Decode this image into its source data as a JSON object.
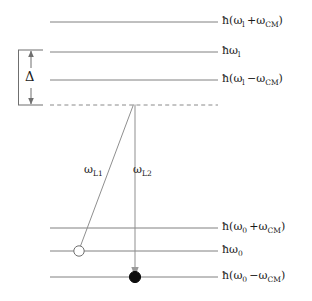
{
  "figure": {
    "type": "energy-level-diagram",
    "title": "",
    "background_color": "#ffffff",
    "line_color": "#808080",
    "text_color": "#1a1a1a",
    "transition_color": "#909090"
  },
  "upper_manifold": {
    "levels": [
      {
        "id": "upper-plus",
        "label": "ħ(ωl+ωCM)",
        "label_html": "ħ(ω<sub>l</sub> +ω<sub>CM</sub>)",
        "style": "solid",
        "y": 22
      },
      {
        "id": "upper-center",
        "label": "ħωl",
        "label_html": "ħω<sub>l</sub>",
        "style": "solid",
        "y": 52
      },
      {
        "id": "upper-minus",
        "label": "ħ(ωl−ωCM)",
        "label_html": "ħ(ω<sub>l</sub> −ω<sub>CM</sub>)",
        "style": "solid",
        "y": 80
      },
      {
        "id": "virtual-level",
        "label": "",
        "label_html": "",
        "style": "dashed",
        "y": 105
      }
    ]
  },
  "lower_manifold": {
    "levels": [
      {
        "id": "lower-plus",
        "label": "ħ(ω0+ωCM)",
        "label_html": "ħ(ω<sub>0</sub> +ω<sub>CM</sub>)",
        "style": "solid",
        "y": 228
      },
      {
        "id": "lower-center",
        "label": "ħω0",
        "label_html": "ħω<sub>0</sub>",
        "style": "solid",
        "y": 251
      },
      {
        "id": "lower-minus",
        "label": "ħ(ω0−ωCM)",
        "label_html": "ħ(ω<sub>0</sub> −ω<sub>CM</sub>)",
        "style": "solid",
        "y": 277
      }
    ]
  },
  "detuning": {
    "symbol": "Δ",
    "from_level": "upper-center",
    "to_level": "virtual-level"
  },
  "transitions": [
    {
      "id": "omega-L1",
      "label": "ωL1",
      "label_html": "ω<sub>L1</sub>",
      "from": "lower-center",
      "to": "virtual-level",
      "arrowhead": false,
      "marker": "open-circle"
    },
    {
      "id": "omega-L2",
      "label": "ωL2",
      "label_html": "ω<sub>L2</sub>",
      "from": "virtual-level",
      "to": "lower-minus",
      "arrowhead": true,
      "marker": "filled-circle"
    }
  ],
  "markers": [
    {
      "id": "initial-state-marker",
      "kind": "open-circle",
      "on_level": "lower-center",
      "x": 79,
      "y": 251
    },
    {
      "id": "final-state-marker",
      "kind": "filled-circle",
      "on_level": "lower-minus",
      "x": 135,
      "y": 277
    }
  ]
}
